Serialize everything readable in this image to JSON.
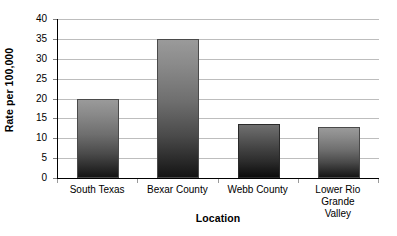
{
  "chart_data": {
    "type": "bar",
    "title": "",
    "subtitle": "",
    "xlabel": "Location",
    "ylabel": "Rate per 100,000",
    "categories": [
      "South Texas",
      "Bexar County",
      "Webb County",
      "Lower Rio Grande Valley"
    ],
    "values": [
      20,
      35,
      13.5,
      12.8
    ],
    "ylim": [
      0,
      40
    ],
    "ytick_step": 5,
    "ytick_labels": [
      "0",
      "5",
      "10",
      "15",
      "20",
      "25",
      "30",
      "35",
      "40"
    ],
    "ytick_values": [
      0,
      5,
      10,
      15,
      20,
      25,
      30,
      35,
      40
    ],
    "grid": true,
    "grid_axis": "y",
    "legend": false,
    "legend_position": "none",
    "orientation": "vertical",
    "bar_style": "vertical-gradient-gray",
    "colors": {
      "background": "#ffffff",
      "gridline": "#bdbdbd",
      "axis": "#000000",
      "bar_top": "#9a9a9a",
      "bar_bottom": "#141414",
      "bar_top_dark": "#6f6f6f",
      "bar_bottom_dark": "#0b0b0b",
      "text": "#000000"
    },
    "bars": [
      {
        "label": "South Texas",
        "label_lines": [
          "South Texas"
        ],
        "value": 20,
        "shade": "light"
      },
      {
        "label": "Bexar County",
        "label_lines": [
          "Bexar County"
        ],
        "value": 35,
        "shade": "light"
      },
      {
        "label": "Webb County",
        "label_lines": [
          "Webb County"
        ],
        "value": 13.5,
        "shade": "dark"
      },
      {
        "label": "Lower Rio Grande Valley",
        "label_lines": [
          "Lower Rio Grande",
          "Valley"
        ],
        "value": 12.8,
        "shade": "light"
      }
    ]
  }
}
